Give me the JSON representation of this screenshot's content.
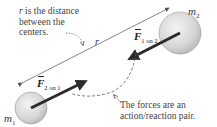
{
  "diagram": {
    "notes": {
      "distance_line1": "is the distance",
      "distance_var": "r",
      "distance_line2": "between the",
      "distance_line3": "centers.",
      "pair_line1": "The forces are an",
      "pair_line2": "action/reaction pair."
    },
    "masses": {
      "m1": {
        "symbol": "m",
        "sub": "1"
      },
      "m2": {
        "symbol": "m",
        "sub": "2"
      }
    },
    "forces": {
      "f1on2": {
        "symbol": "F",
        "sub": "1 on 2"
      },
      "f2on1": {
        "symbol": "F",
        "sub": "2 on 1"
      }
    },
    "distance_label": "r",
    "colors": {
      "sphere_fill": "#d9d9d9",
      "force_arrow": "#2b2b2b",
      "guide_line": "#555555"
    }
  }
}
